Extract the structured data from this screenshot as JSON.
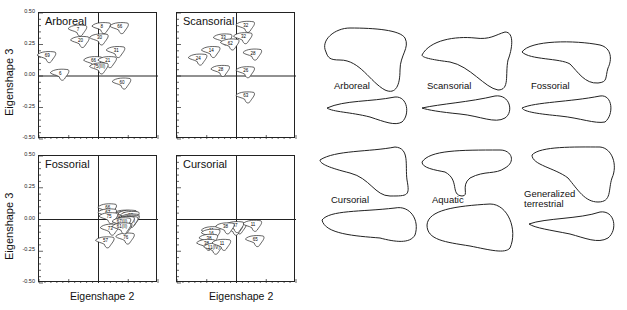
{
  "figure": {
    "y_axis_label": "Eigenshape 3",
    "x_axis_label": "Eigenshape 2",
    "y_ticks": [
      "0.50",
      "0.25",
      "0.00",
      "-0.25",
      "-0.50"
    ],
    "panels": [
      {
        "title": "Arboreal",
        "labels": [
          "7",
          "8",
          "66",
          "20",
          "30",
          "31",
          "69",
          "66",
          "21",
          "75(III)",
          "6",
          "60"
        ]
      },
      {
        "title": "Scansorial",
        "labels": [
          "32",
          "32",
          "33",
          "62",
          "14",
          "24",
          "28",
          "28",
          "26",
          "63"
        ]
      },
      {
        "title": "Fossorial",
        "labels": [
          "57",
          "61(II)",
          "67(II)",
          "66",
          "62",
          "67",
          "61(IV)",
          "75(II)",
          "75",
          "75 (II)",
          "73",
          "61",
          "57",
          "76",
          "75",
          "67(II)",
          "61(II)"
        ]
      },
      {
        "title": "Cursorial",
        "labels": [
          "3",
          "4",
          "47",
          "11",
          "38",
          "11",
          "16",
          "38",
          "38",
          "11(IV)",
          "11",
          "65"
        ]
      }
    ]
  },
  "outlines": {
    "labels": [
      "Arboreal",
      "Scansorial",
      "Fossorial",
      "Cursorial",
      "Aquatic",
      "Generalized terrestrial"
    ]
  },
  "chart_data": [
    {
      "type": "scatter",
      "title": "Arboreal",
      "xlabel": "",
      "ylabel": "Eigenshape 3",
      "ylim": [
        -0.5,
        0.5
      ],
      "xlim": [
        -0.5,
        0.5
      ],
      "grid": false,
      "points": [
        {
          "label": "7",
          "x": -0.18,
          "y": 0.36
        },
        {
          "label": "8",
          "x": 0.02,
          "y": 0.38
        },
        {
          "label": "66",
          "x": 0.17,
          "y": 0.38
        },
        {
          "label": "20",
          "x": -0.16,
          "y": 0.27
        },
        {
          "label": "30",
          "x": 0.0,
          "y": 0.29
        },
        {
          "label": "31",
          "x": 0.14,
          "y": 0.19
        },
        {
          "label": "69",
          "x": -0.44,
          "y": 0.15
        },
        {
          "label": "66",
          "x": -0.05,
          "y": 0.11
        },
        {
          "label": "21",
          "x": 0.07,
          "y": 0.11
        },
        {
          "label": "75(III)",
          "x": 0.0,
          "y": 0.06
        },
        {
          "label": "6",
          "x": -0.33,
          "y": 0.01
        },
        {
          "label": "60",
          "x": 0.19,
          "y": -0.06
        }
      ]
    },
    {
      "type": "scatter",
      "title": "Scansorial",
      "xlabel": "",
      "ylabel": "",
      "ylim": [
        -0.5,
        0.5
      ],
      "xlim": [
        -0.5,
        0.5
      ],
      "grid": false,
      "points": [
        {
          "label": "32",
          "x": 0.07,
          "y": 0.39
        },
        {
          "label": "32",
          "x": 0.05,
          "y": 0.3
        },
        {
          "label": "33",
          "x": -0.12,
          "y": 0.29
        },
        {
          "label": "62",
          "x": -0.06,
          "y": 0.25
        },
        {
          "label": "14",
          "x": -0.22,
          "y": 0.19
        },
        {
          "label": "24",
          "x": -0.33,
          "y": 0.13
        },
        {
          "label": "28",
          "x": 0.13,
          "y": 0.17
        },
        {
          "label": "28",
          "x": -0.14,
          "y": 0.04
        },
        {
          "label": "26",
          "x": 0.07,
          "y": 0.03
        },
        {
          "label": "63",
          "x": 0.07,
          "y": -0.17
        }
      ]
    },
    {
      "type": "scatter",
      "title": "Fossorial",
      "xlabel": "Eigenshape 2",
      "ylabel": "Eigenshape 3",
      "ylim": [
        -0.5,
        0.5
      ],
      "xlim": [
        -0.5,
        0.5
      ],
      "grid": false,
      "points": [
        {
          "label": "57",
          "x": 0.2,
          "y": 0.03
        },
        {
          "label": "61(II)",
          "x": 0.2,
          "y": 0.02
        },
        {
          "label": "67(II)",
          "x": 0.24,
          "y": 0.03
        },
        {
          "label": "66",
          "x": 0.07,
          "y": 0.08
        },
        {
          "label": "62",
          "x": 0.26,
          "y": 0.02
        },
        {
          "label": "67",
          "x": 0.07,
          "y": 0.04
        },
        {
          "label": "61(IV)",
          "x": 0.26,
          "y": 0.0
        },
        {
          "label": "75(II)",
          "x": 0.26,
          "y": -0.01
        },
        {
          "label": "75",
          "x": 0.08,
          "y": 0.01
        },
        {
          "label": "75 (II)",
          "x": 0.25,
          "y": -0.02
        },
        {
          "label": "73",
          "x": 0.09,
          "y": -0.08
        },
        {
          "label": "61",
          "x": 0.22,
          "y": -0.02
        },
        {
          "label": "57",
          "x": 0.05,
          "y": -0.18
        },
        {
          "label": "76",
          "x": 0.22,
          "y": -0.15
        },
        {
          "label": "75",
          "x": 0.2,
          "y": -0.07
        },
        {
          "label": "67(II)",
          "x": 0.19,
          "y": -0.03
        },
        {
          "label": "61(II)",
          "x": 0.19,
          "y": -0.07
        }
      ]
    },
    {
      "type": "scatter",
      "title": "Cursorial",
      "xlabel": "Eigenshape 2",
      "ylabel": "",
      "ylim": [
        -0.5,
        0.5
      ],
      "xlim": [
        -0.5,
        0.5
      ],
      "grid": false,
      "points": [
        {
          "label": "3",
          "x": 0.0,
          "y": -0.07
        },
        {
          "label": "4",
          "x": -0.03,
          "y": -0.08
        },
        {
          "label": "47",
          "x": -0.02,
          "y": -0.06
        },
        {
          "label": "11",
          "x": -0.22,
          "y": -0.1
        },
        {
          "label": "38",
          "x": -0.1,
          "y": -0.07
        },
        {
          "label": "11",
          "x": 0.13,
          "y": -0.05
        },
        {
          "label": "16",
          "x": -0.22,
          "y": -0.12
        },
        {
          "label": "38",
          "x": -0.24,
          "y": -0.16
        },
        {
          "label": "38",
          "x": -0.26,
          "y": -0.2
        },
        {
          "label": "11(IV)",
          "x": -0.2,
          "y": -0.23
        },
        {
          "label": "11",
          "x": -0.13,
          "y": -0.2
        },
        {
          "label": "65",
          "x": 0.15,
          "y": -0.17
        }
      ]
    }
  ]
}
